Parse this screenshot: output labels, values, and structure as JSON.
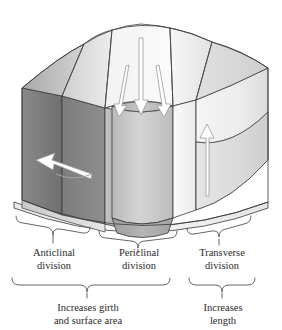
{
  "figure": {
    "type": "diagram"
  },
  "labels": {
    "anticlinal": {
      "line1": "Anticlinal",
      "line2": "division"
    },
    "periclinal": {
      "line1": "Periclinal",
      "line2": "division"
    },
    "transverse": {
      "line1": "Transverse",
      "line2": "division"
    },
    "girth": {
      "line1": "Increases girth",
      "line2": "and surface area"
    },
    "length": {
      "line1": "Increases",
      "line2": "length"
    }
  },
  "arrows": {
    "anticlinal_arrow": "curved-left-arrow",
    "periclinal_arrow_left": "down-arrow",
    "periclinal_arrow_center": "down-arrow",
    "periclinal_arrow_right": "down-arrow",
    "transverse_arrow": "up-arrow"
  },
  "colors": {
    "outline": "#3a3a3a",
    "bracket": "#555555",
    "text": "#2b2b2b",
    "face_dark": "#808080",
    "face_mid": "#b4b4b4",
    "face_light": "#d8d8d8",
    "face_pale": "#efefef",
    "arrow_fill": "#ffffff",
    "arrow_stroke": "#9a9a9a",
    "background": "#ffffff"
  }
}
